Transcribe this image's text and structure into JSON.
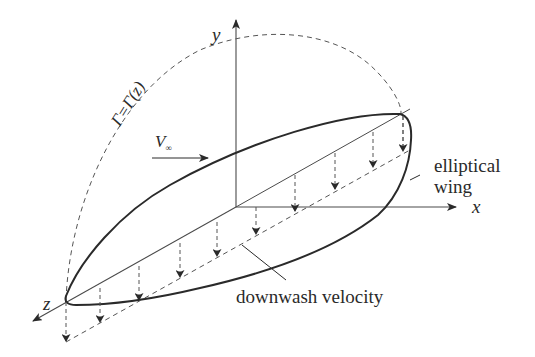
{
  "diagram": {
    "axes": {
      "x_label": "x",
      "y_label": "y",
      "z_label": "z"
    },
    "labels": {
      "circulation": "Γ=Γ(z)",
      "freestream": "V",
      "freestream_sub": "∞",
      "wing_line1": "elliptical",
      "wing_line2": "wing",
      "downwash": "downwash velocity"
    },
    "colors": {
      "stroke": "#2a2a2a",
      "thin": "#4a4a4a",
      "background": "#ffffff"
    },
    "elements": [
      {
        "type": "axis",
        "name": "x-axis"
      },
      {
        "type": "axis",
        "name": "y-axis"
      },
      {
        "type": "axis",
        "name": "z-axis"
      },
      {
        "type": "outline",
        "name": "elliptical-wing-planform"
      },
      {
        "type": "dashed-curve",
        "name": "circulation-distribution"
      },
      {
        "type": "dashed-line",
        "name": "downwash-baseline"
      },
      {
        "type": "arrows",
        "name": "downwash-arrows",
        "count": 9
      },
      {
        "type": "arrow",
        "name": "freestream-arrow"
      }
    ]
  }
}
